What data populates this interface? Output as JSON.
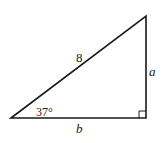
{
  "diagram": {
    "type": "right-triangle",
    "hypotenuse_label": "8",
    "vertical_side_label": "a",
    "horizontal_side_label": "b",
    "angle_label": "37°",
    "right_angle_marker": true,
    "stroke_color": "#1a1a1a",
    "background_color": "#ffffff"
  }
}
